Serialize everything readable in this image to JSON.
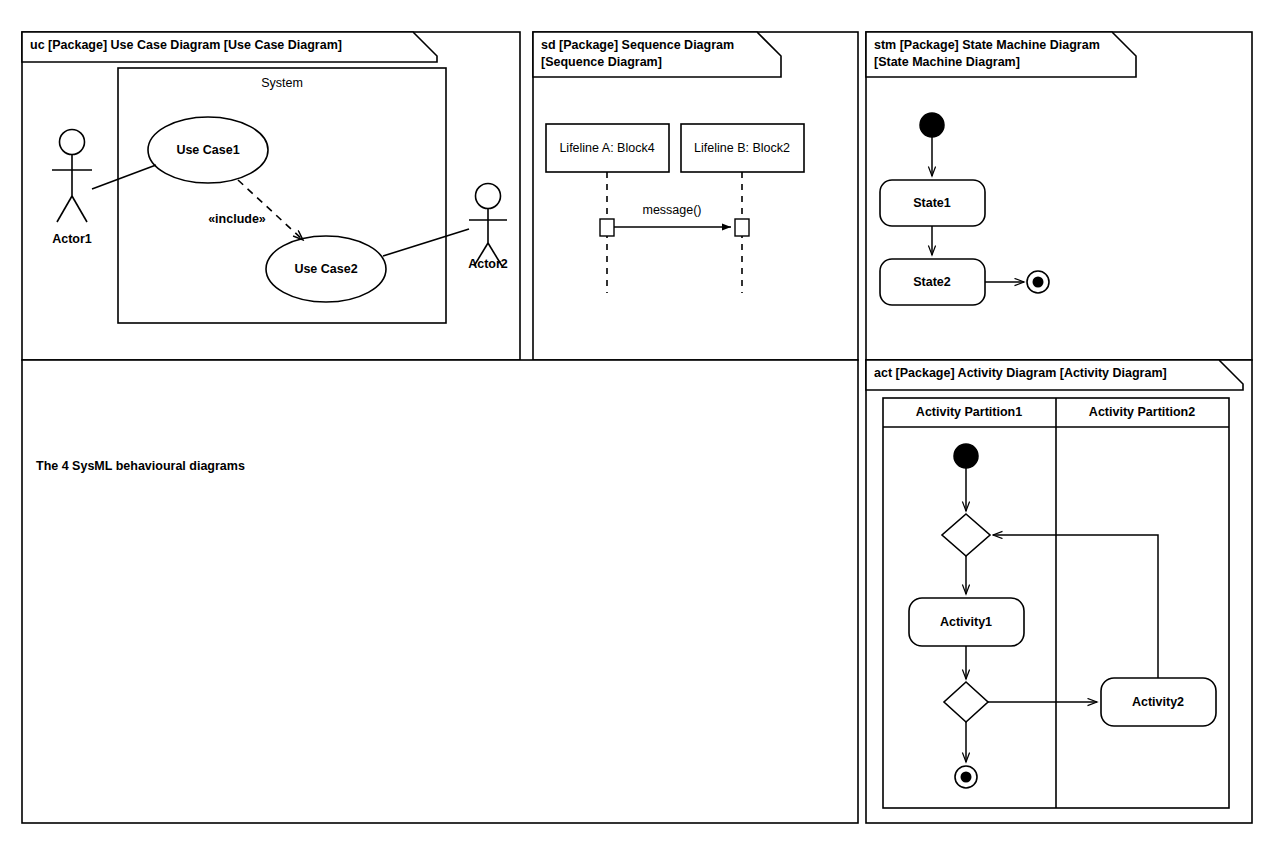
{
  "caption": {
    "text": "The 4 SysML behavioural diagrams"
  },
  "frames": {
    "use_case": {
      "label_line1": "uc [Package] Use Case Diagram [Use Case Diagram]",
      "system_label": "System",
      "actor1": "Actor1",
      "actor2": "Actor2",
      "use_case1": "Use Case1",
      "use_case2": "Use Case2",
      "include_stereotype": "«include»"
    },
    "sequence": {
      "label_line1": "sd [Package] Sequence Diagram",
      "label_line2": "[Sequence Diagram]",
      "lifeline_a": "Lifeline A: Block4",
      "lifeline_b": "Lifeline B: Block2",
      "message": "message()"
    },
    "state_machine": {
      "label_line1": "stm [Package] State Machine Diagram",
      "label_line2": "[State Machine Diagram]",
      "state1": "State1",
      "state2": "State2",
      "initial_node": "initial-state-node",
      "final_node": "final-state-node"
    },
    "activity": {
      "label_line1": "act [Package] Activity Diagram [Activity Diagram]",
      "partition1": "Activity Partition1",
      "partition2": "Activity Partition2",
      "activity1": "Activity1",
      "activity2": "Activity2",
      "initial_node": "initial-activity-node",
      "final_node": "activity-final-node",
      "merge_node": "merge-node",
      "decision_node": "decision-node"
    }
  },
  "colors": {
    "line": "#000000",
    "background": "#ffffff",
    "fill": "#ffffff"
  }
}
